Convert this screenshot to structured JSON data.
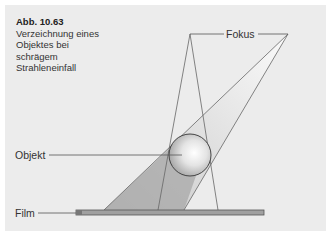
{
  "figure": {
    "number": "Abb. 10.63",
    "caption_lines": [
      "Verzeichnung eines",
      "Objektes bei",
      "schrägem",
      "Strahleneinfall"
    ]
  },
  "labels": {
    "focus": "Fokus",
    "object": "Objekt",
    "film": "Film"
  },
  "colors": {
    "background": "#ececec",
    "shadow_dark": "#a8a8a8",
    "beam_light": "#d0d0d0",
    "beam_white": "#f8f8f8",
    "line": "#555555",
    "film_fill": "#a0a0a0"
  }
}
